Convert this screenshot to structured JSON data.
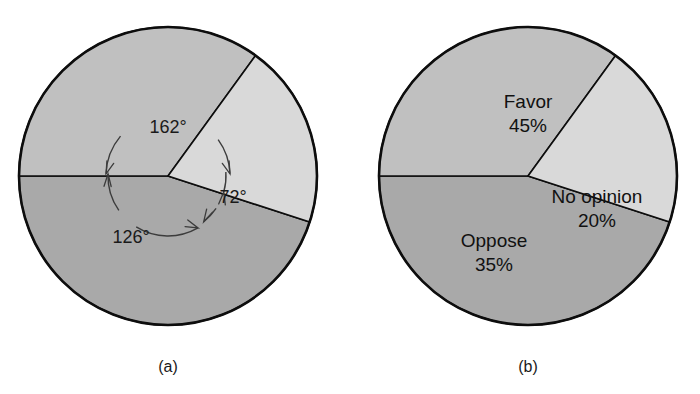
{
  "figure": {
    "background_color": "#ffffff",
    "panels": [
      {
        "id": "panel-a",
        "caption": "(a)",
        "caption_x": 168,
        "caption_y": 372,
        "center_x": 168,
        "center_y": 176,
        "radius": 149,
        "show_angle_annotations": true,
        "show_slice_labels": false
      },
      {
        "id": "panel-b",
        "caption": "(b)",
        "caption_x": 528,
        "caption_y": 372,
        "center_x": 528,
        "center_y": 176,
        "radius": 149,
        "show_angle_annotations": false,
        "show_slice_labels": true
      }
    ]
  },
  "chart_data": {
    "type": "pie",
    "title": "",
    "subtitle": "",
    "xlabel": "",
    "ylabel": "",
    "legend_position": "none",
    "grid": false,
    "units": "percent",
    "total": 100,
    "start_angle_deg": 180,
    "direction": "counterclockwise",
    "categories": [
      "Favor",
      "Oppose",
      "No opinion"
    ],
    "values": [
      45,
      35,
      20
    ],
    "percent_labels": [
      "45%",
      "35%",
      "20%"
    ],
    "angles_deg": [
      162,
      126,
      72
    ],
    "angle_labels": [
      "162°",
      "126°",
      "72°"
    ],
    "colors": [
      "#a9a9a9",
      "#c0c0c0",
      "#d9d9d9"
    ],
    "slices": [
      {
        "name": "Favor",
        "value": 45,
        "percent_label": "45%",
        "angle_deg": 162,
        "angle_label": "162°",
        "color": "#a9a9a9",
        "start_deg": 180,
        "end_deg": 342,
        "label_x": 528,
        "label_y": 108,
        "percent_x": 528,
        "percent_y": 132,
        "angle_label_x": 168,
        "angle_label_y": 133
      },
      {
        "name": "Oppose",
        "value": 35,
        "percent_label": "35%",
        "angle_deg": 126,
        "angle_label": "126°",
        "color": "#c0c0c0",
        "start_deg": 54,
        "end_deg": 180,
        "label_x": 494,
        "label_y": 247,
        "percent_x": 494,
        "percent_y": 271,
        "angle_label_x": 131,
        "angle_label_y": 243
      },
      {
        "name": "No opinion",
        "value": 20,
        "percent_label": "20%",
        "angle_deg": 72,
        "angle_label": "72°",
        "color": "#d9d9d9",
        "start_deg": 342,
        "end_deg": 54,
        "label_x": 597,
        "label_y": 203,
        "percent_x": 597,
        "percent_y": 227,
        "angle_label_x": 233,
        "angle_label_y": 203
      }
    ]
  }
}
